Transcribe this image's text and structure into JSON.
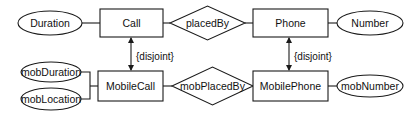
{
  "diagram": {
    "type": "er-diagram",
    "entities": [
      {
        "id": "call",
        "label": "Call"
      },
      {
        "id": "phone",
        "label": "Phone"
      },
      {
        "id": "mobilecall",
        "label": "MobileCall"
      },
      {
        "id": "mobilephone",
        "label": "MobilePhone"
      }
    ],
    "relationships": [
      {
        "id": "placedby",
        "label": "placedBy",
        "connects": [
          "Call",
          "Phone"
        ]
      },
      {
        "id": "mobplacedby",
        "label": "mobPlacedBy",
        "connects": [
          "MobileCall",
          "MobilePhone"
        ]
      }
    ],
    "attributes": [
      {
        "id": "duration",
        "label": "Duration",
        "of": "Call"
      },
      {
        "id": "number",
        "label": "Number",
        "of": "Phone"
      },
      {
        "id": "mobduration",
        "label": "mobDuration",
        "of": "MobileCall"
      },
      {
        "id": "moblocation",
        "label": "mobLocation",
        "of": "MobileCall"
      },
      {
        "id": "mobnumber",
        "label": "mobNumber",
        "of": "MobilePhone"
      }
    ],
    "constraints": [
      {
        "id": "call-disjoint",
        "label": "{disjoint}",
        "between": [
          "Call",
          "MobileCall"
        ]
      },
      {
        "id": "phone-disjoint",
        "label": "{disjoint}",
        "between": [
          "Phone",
          "MobilePhone"
        ]
      }
    ],
    "colors": {
      "stroke": "#1a1a1a",
      "fill": "#ffffff",
      "text": "#111111"
    }
  }
}
